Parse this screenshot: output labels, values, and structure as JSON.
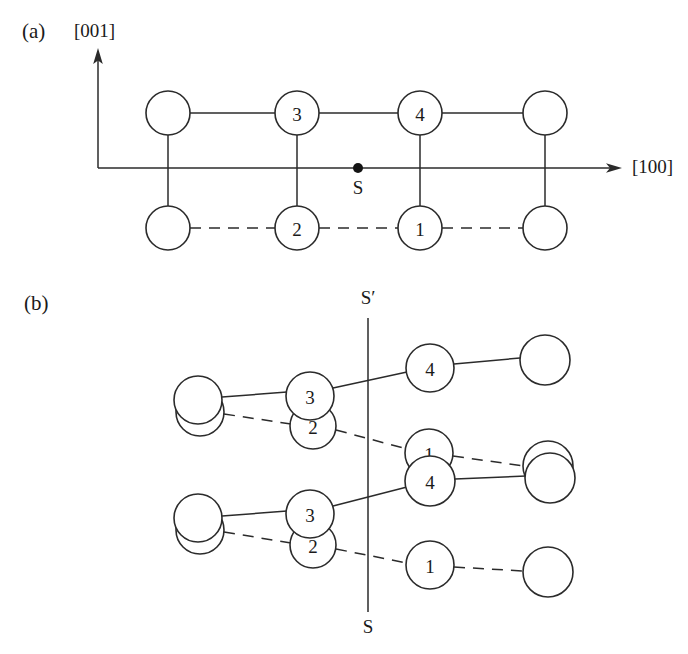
{
  "figure": {
    "stroke_color": "#2b2b2b",
    "fill_color": "#ffffff",
    "panels": [
      {
        "id": "a",
        "label": "(a)",
        "label_x": 22,
        "label_y": 33,
        "axes": {
          "vertical": {
            "label": "[001]",
            "label_x": 74,
            "label_y": 33,
            "x": 98,
            "y_top": 52,
            "y_bottom": 168
          },
          "horizontal": {
            "label": "[100]",
            "label_x": 632,
            "label_y": 169,
            "y": 168,
            "x_left": 98,
            "x_right": 620
          }
        },
        "site_marker": {
          "label": "S",
          "x": 358,
          "y": 168,
          "radius": 5,
          "label_x": 358,
          "label_y": 190
        },
        "atoms": [
          {
            "id": "a-tl",
            "label": "",
            "cx": 168,
            "cy": 113,
            "r": 22
          },
          {
            "id": "a-t3",
            "label": "3",
            "cx": 297,
            "cy": 113,
            "r": 22
          },
          {
            "id": "a-t4",
            "label": "4",
            "cx": 420,
            "cy": 113,
            "r": 22
          },
          {
            "id": "a-tr",
            "label": "",
            "cx": 545,
            "cy": 113,
            "r": 22
          },
          {
            "id": "a-bl",
            "label": "",
            "cx": 168,
            "cy": 228,
            "r": 22
          },
          {
            "id": "a-b2",
            "label": "2",
            "cx": 297,
            "cy": 228,
            "r": 22
          },
          {
            "id": "a-b1",
            "label": "1",
            "cx": 420,
            "cy": 228,
            "r": 22
          },
          {
            "id": "a-br",
            "label": "",
            "cx": 545,
            "cy": 228,
            "r": 22
          }
        ],
        "bonds": [
          {
            "style": "solid",
            "x1": 190,
            "y1": 113,
            "x2": 275,
            "y2": 113
          },
          {
            "style": "solid",
            "x1": 319,
            "y1": 113,
            "x2": 398,
            "y2": 113
          },
          {
            "style": "solid",
            "x1": 442,
            "y1": 113,
            "x2": 523,
            "y2": 113
          },
          {
            "style": "solid",
            "x1": 168,
            "y1": 135,
            "x2": 168,
            "y2": 206
          },
          {
            "style": "solid",
            "x1": 297,
            "y1": 135,
            "x2": 297,
            "y2": 206
          },
          {
            "style": "solid",
            "x1": 420,
            "y1": 135,
            "x2": 420,
            "y2": 206
          },
          {
            "style": "solid",
            "x1": 545,
            "y1": 135,
            "x2": 545,
            "y2": 206
          },
          {
            "style": "dashed",
            "x1": 190,
            "y1": 228,
            "x2": 275,
            "y2": 228
          },
          {
            "style": "dashed",
            "x1": 319,
            "y1": 228,
            "x2": 398,
            "y2": 228
          },
          {
            "style": "dashed",
            "x1": 442,
            "y1": 228,
            "x2": 523,
            "y2": 228
          }
        ]
      },
      {
        "id": "b",
        "label": "(b)",
        "label_x": 24,
        "label_y": 305,
        "mirror": {
          "x": 368,
          "y_top": 318,
          "y_bottom": 612,
          "top_label": "S′",
          "top_label_x": 368,
          "top_label_y": 300,
          "bottom_label": "S",
          "bottom_label_x": 368,
          "bottom_label_y": 629
        },
        "atoms": [
          {
            "id": "b-l1a",
            "label": "",
            "cx": 198,
            "cy": 400,
            "r": 24
          },
          {
            "id": "b-l1b",
            "label": "",
            "cx": 200,
            "cy": 412,
            "r": 24
          },
          {
            "id": "b-u3",
            "label": "3",
            "cx": 310,
            "cy": 396,
            "r": 24
          },
          {
            "id": "b-u2",
            "label": "2",
            "cx": 313,
            "cy": 426,
            "r": 23
          },
          {
            "id": "b-u4",
            "label": "4",
            "cx": 430,
            "cy": 368,
            "r": 24
          },
          {
            "id": "b-ur",
            "label": "",
            "cx": 545,
            "cy": 360,
            "r": 25
          },
          {
            "id": "b-m1",
            "label": "1",
            "cx": 429,
            "cy": 453,
            "r": 24
          },
          {
            "id": "b-m4",
            "label": "4",
            "cx": 430,
            "cy": 481,
            "r": 25
          },
          {
            "id": "b-mr1",
            "label": "",
            "cx": 548,
            "cy": 466,
            "r": 25
          },
          {
            "id": "b-mr2",
            "label": "",
            "cx": 550,
            "cy": 478,
            "r": 25
          },
          {
            "id": "b-l2a",
            "label": "",
            "cx": 198,
            "cy": 518,
            "r": 24
          },
          {
            "id": "b-l2b",
            "label": "",
            "cx": 200,
            "cy": 530,
            "r": 24
          },
          {
            "id": "b-d3",
            "label": "3",
            "cx": 310,
            "cy": 514,
            "r": 24
          },
          {
            "id": "b-d2",
            "label": "2",
            "cx": 313,
            "cy": 545,
            "r": 23
          },
          {
            "id": "b-d1",
            "label": "1",
            "cx": 430,
            "cy": 565,
            "r": 24
          },
          {
            "id": "b-dr",
            "label": "",
            "cx": 548,
            "cy": 572,
            "r": 25
          }
        ],
        "bonds": [
          {
            "style": "solid",
            "x1": 222,
            "y1": 397,
            "x2": 287,
            "y2": 392
          },
          {
            "style": "solid",
            "x1": 333,
            "y1": 388,
            "x2": 407,
            "y2": 372
          },
          {
            "style": "solid",
            "x1": 454,
            "y1": 364,
            "x2": 520,
            "y2": 358
          },
          {
            "style": "dashed",
            "x1": 224,
            "y1": 414,
            "x2": 291,
            "y2": 424
          },
          {
            "style": "dashed",
            "x1": 336,
            "y1": 430,
            "x2": 407,
            "y2": 449
          },
          {
            "style": "dashed",
            "x1": 453,
            "y1": 456,
            "x2": 524,
            "y2": 466
          },
          {
            "style": "solid",
            "x1": 222,
            "y1": 516,
            "x2": 287,
            "y2": 511
          },
          {
            "style": "solid",
            "x1": 333,
            "y1": 506,
            "x2": 407,
            "y2": 487
          },
          {
            "style": "solid",
            "x1": 455,
            "y1": 479,
            "x2": 526,
            "y2": 476
          },
          {
            "style": "dashed",
            "x1": 224,
            "y1": 532,
            "x2": 291,
            "y2": 543
          },
          {
            "style": "dashed",
            "x1": 336,
            "y1": 549,
            "x2": 407,
            "y2": 563
          },
          {
            "style": "dashed",
            "x1": 454,
            "y1": 567,
            "x2": 524,
            "y2": 571
          }
        ]
      }
    ]
  }
}
